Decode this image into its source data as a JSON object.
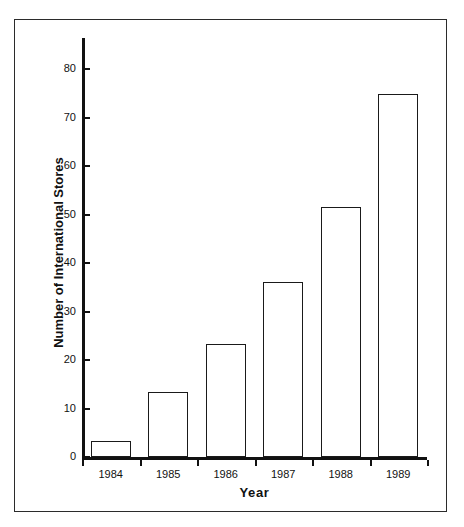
{
  "chart_data": {
    "type": "bar",
    "title": "",
    "xlabel": "Year",
    "ylabel": "Number of International Stores",
    "categories": [
      "1984",
      "1985",
      "1986",
      "1987",
      "1988",
      "1989"
    ],
    "values": [
      3.3,
      13.5,
      23.3,
      36.0,
      51.5,
      74.8
    ],
    "ylim": [
      0,
      85
    ],
    "yticks": [
      0,
      10,
      20,
      30,
      40,
      50,
      60,
      70,
      80
    ],
    "ytick_labels": [
      "0",
      "10",
      "20",
      "30",
      "40",
      "50",
      "60",
      "70",
      "80"
    ],
    "grid": false,
    "legend": false,
    "bar_fill_color": "#ffffff",
    "bar_edge_color": "#1a1a1a",
    "axis_color": "#111111",
    "background_color": "#ffffff",
    "frame_color": "#2b2b2b"
  },
  "axis": {
    "y_title": "Number of International Stores",
    "x_title": "Year"
  }
}
